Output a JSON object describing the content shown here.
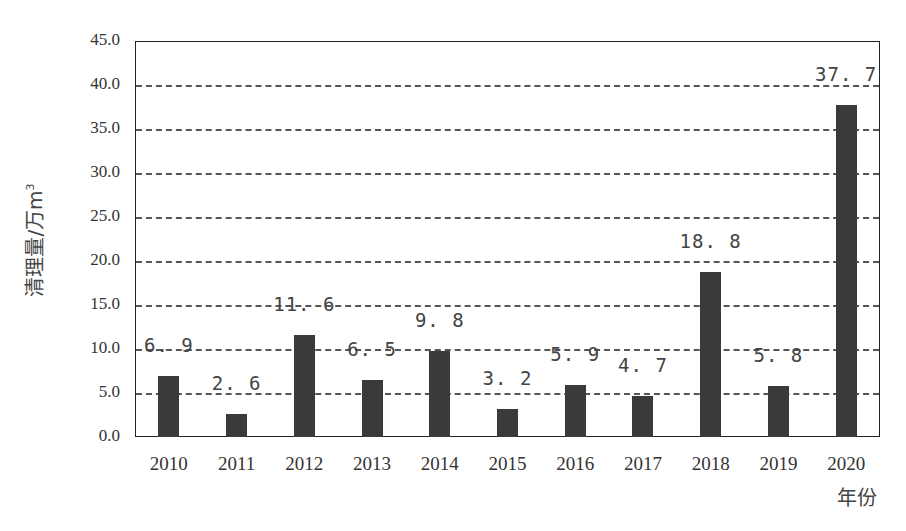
{
  "chart_data": {
    "type": "bar",
    "title": "",
    "xlabel": "年份",
    "ylabel": "清理量/万m³",
    "ylim": [
      0,
      45
    ],
    "yticks": [
      "0.0",
      "5.0",
      "10.0",
      "15.0",
      "20.0",
      "25.0",
      "30.0",
      "35.0",
      "40.0",
      "45.0"
    ],
    "grid": {
      "y": true,
      "style": "dashed"
    },
    "legend": null,
    "categories": [
      "2010",
      "2011",
      "2012",
      "2013",
      "2014",
      "2015",
      "2016",
      "2017",
      "2018",
      "2019",
      "2020"
    ],
    "values": [
      6.9,
      2.6,
      11.6,
      6.5,
      9.8,
      3.2,
      5.9,
      4.7,
      18.8,
      5.8,
      37.7
    ],
    "value_labels": [
      "6.9",
      "2.6",
      "11.6",
      "6.5",
      "9.8",
      "3.2",
      "5.9",
      "4.7",
      "18.8",
      "5.8",
      "37.7"
    ],
    "bar_color": "#3a3a3a"
  },
  "axis": {
    "y_title": "清理量/万m",
    "y_title_sup": "3",
    "x_title": "年份"
  }
}
